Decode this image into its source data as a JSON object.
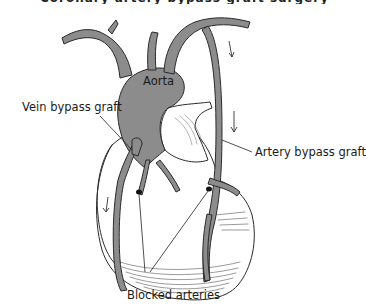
{
  "figure": {
    "title_fragment": "Coronary artery bypass graft surgery",
    "labels": {
      "aorta": "Aorta",
      "vein_graft": "Vein bypass graft",
      "artery_graft": "Artery bypass graft",
      "blocked": "Blocked arteries"
    },
    "colors": {
      "vessel_fill": "#8c8c8c",
      "outline": "#2a2a2a",
      "heart_fill": "#ffffff",
      "blockage": "#111111"
    }
  }
}
